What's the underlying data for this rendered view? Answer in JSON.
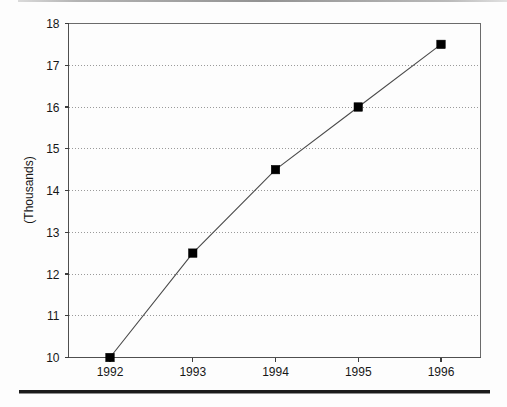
{
  "chart_data": {
    "type": "line",
    "title": "",
    "subtitle": "",
    "xlabel": "",
    "ylabel": "(Thousands)",
    "categories": [
      "1992",
      "1993",
      "1994",
      "1995",
      "1996"
    ],
    "x": [
      1992,
      1993,
      1994,
      1995,
      1996
    ],
    "values": [
      10,
      12.5,
      14.5,
      16,
      17.5
    ],
    "series": [
      {
        "name": "",
        "values": [
          10,
          12.5,
          14.5,
          16,
          17.5
        ]
      }
    ],
    "ylim": [
      10,
      18
    ],
    "yticks": [
      10,
      11,
      12,
      13,
      14,
      15,
      16,
      17,
      18
    ],
    "ytick_labels": [
      "10",
      "11",
      "12",
      "13",
      "14",
      "15",
      "16",
      "17",
      "18"
    ],
    "xtick_labels": [
      "1992",
      "1993",
      "1994",
      "1995",
      "1996"
    ],
    "grid": {
      "horizontal": true,
      "vertical": false,
      "style": "dotted"
    },
    "legend": {
      "visible": false,
      "position": "none"
    },
    "marker": "square",
    "colors": {
      "line": "#4a4a4a",
      "marker": "#000000",
      "grid": "#9a9a9a",
      "axis": "#6b6b6b",
      "text": "#171717",
      "background": "#fdfdfd"
    }
  },
  "page": {
    "top_rule": "",
    "bottom_rule": ""
  }
}
